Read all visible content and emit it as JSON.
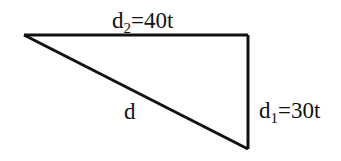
{
  "diagram": {
    "type": "right-triangle",
    "stroke_color": "#111111",
    "background": "#ffffff",
    "vertices": {
      "top_left": [
        24,
        35
      ],
      "top_right": [
        248,
        35
      ],
      "bottom_right": [
        248,
        149
      ]
    },
    "labels": {
      "top_side": {
        "base": "d",
        "subscript": "2",
        "rest": "=40t",
        "full": "d2=40t"
      },
      "right_side": {
        "base": "d",
        "subscript": "1",
        "rest": "=30t",
        "full": "d1=30t"
      },
      "hypotenuse": {
        "base": "d",
        "full": "d"
      }
    }
  }
}
